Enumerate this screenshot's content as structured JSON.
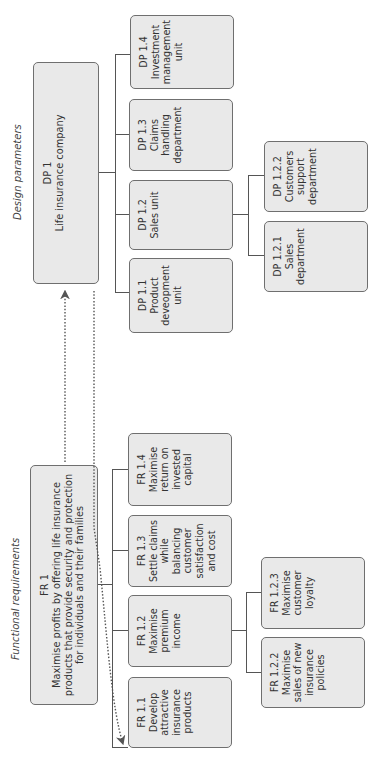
{
  "functional_requirements": {
    "heading": "Functional requirements",
    "root": {
      "id": "FR 1",
      "text": "Maximise profits by offering life insurance products that provide security and protection for individuals and their families"
    },
    "children": [
      {
        "id": "FR 1.1",
        "text": "Develop\nattractive\ninsurance\nproducts"
      },
      {
        "id": "FR 1.2",
        "text": "Maximise\npremium\nincome"
      },
      {
        "id": "FR 1.3",
        "text": "Settle claims\nwhile\nbalancing\ncustomer\nsatisfaction\nand cost"
      },
      {
        "id": "FR 1.4",
        "text": "Maximise\nreturn on\ninvested\ncapital"
      }
    ],
    "grandchildren": [
      {
        "id": "FR 1.2.2",
        "text": "Maximise\nsales of new\ninsurance\npolicies"
      },
      {
        "id": "FR 1.2.3",
        "text": "Maximise\ncustomer\nloyalty"
      }
    ]
  },
  "design_parameters": {
    "heading": "Design parameters",
    "root": {
      "id": "DP 1",
      "text": "Life insurance company"
    },
    "children": [
      {
        "id": "DP 1.1",
        "text": "Product\ndeveopment\nunit"
      },
      {
        "id": "DP 1.2",
        "text": "Sales unit"
      },
      {
        "id": "DP 1.3",
        "text": "Claims\nhandling\ndepartment"
      },
      {
        "id": "DP 1.4",
        "text": "Investment\nmanagement\nunit"
      }
    ],
    "grandchildren": [
      {
        "id": "DP 1.2.1",
        "text": "Sales\ndepartment"
      },
      {
        "id": "DP 1.2.2",
        "text": "Customers\nsupport\ndepartment"
      }
    ]
  },
  "colors": {
    "box_fill": "#e9e9e9",
    "box_border": "#6f6f6f",
    "line": "#555555"
  }
}
